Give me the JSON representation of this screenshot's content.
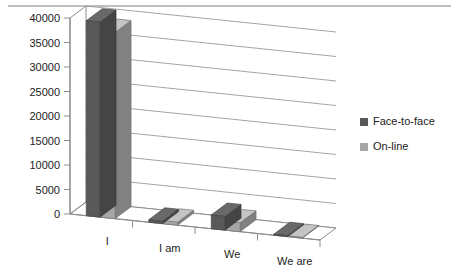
{
  "chart_data": {
    "type": "bar",
    "title": "",
    "xlabel": "",
    "ylabel": "",
    "categories": [
      "I",
      "I am",
      "We",
      "We are"
    ],
    "series": [
      {
        "name": "Face-to-face",
        "color": "#595959",
        "values": [
          39800,
          500,
          2800,
          200
        ]
      },
      {
        "name": "On-line",
        "color": "#a6a6a6",
        "values": [
          38000,
          600,
          1800,
          150
        ]
      }
    ],
    "ylim": [
      0,
      40000
    ],
    "ytick_values": [
      0,
      5000,
      10000,
      15000,
      20000,
      25000,
      30000,
      35000,
      40000
    ],
    "ytick_labels": [
      "0",
      "5000",
      "10000",
      "15000",
      "20000",
      "25000",
      "30000",
      "35000",
      "40000"
    ],
    "grid": true,
    "legend_position": "right",
    "style": "3d-column",
    "axis_line_color": "#8c8c8c",
    "grid_line_color": "#9a9a9a",
    "plot_background": "#ffffff",
    "top_rule_color": "#aaaaaa"
  },
  "legend": {
    "entries": [
      {
        "label": "Face-to-face",
        "swatch_color": "#595959"
      },
      {
        "label": "On-line",
        "swatch_color": "#a6a6a6"
      }
    ]
  },
  "decor": {
    "top_rule": ""
  }
}
